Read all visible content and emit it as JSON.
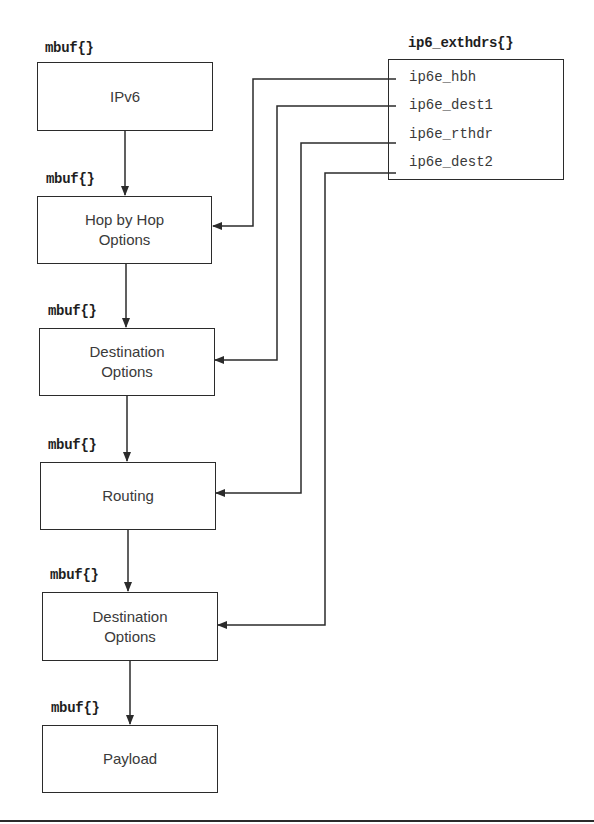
{
  "diagram": {
    "type": "mbuf chain with extension header pointers",
    "chain_label": "mbuf{}",
    "chain": [
      {
        "id": "ipv6",
        "label": "IPv6",
        "mbuf_label": "mbuf{}"
      },
      {
        "id": "hbh",
        "label": "Hop by Hop\nOptions",
        "mbuf_label": "mbuf{}"
      },
      {
        "id": "dest1",
        "label": "Destination\nOptions",
        "mbuf_label": "mbuf{}"
      },
      {
        "id": "routing",
        "label": "Routing",
        "mbuf_label": "mbuf{}"
      },
      {
        "id": "dest2",
        "label": "Destination\nOptions",
        "mbuf_label": "mbuf{}"
      },
      {
        "id": "payload",
        "label": "Payload",
        "mbuf_label": "mbuf{}"
      }
    ],
    "struct": {
      "title": "ip6_exthdrs{}",
      "fields": [
        {
          "name": "ip6e_hbh",
          "points_to": "hbh"
        },
        {
          "name": "ip6e_dest1",
          "points_to": "dest1"
        },
        {
          "name": "ip6e_rthdr",
          "points_to": "routing"
        },
        {
          "name": "ip6e_dest2",
          "points_to": "dest2"
        }
      ]
    },
    "edges": [
      {
        "from": "ipv6",
        "to": "hbh"
      },
      {
        "from": "hbh",
        "to": "dest1"
      },
      {
        "from": "dest1",
        "to": "routing"
      },
      {
        "from": "routing",
        "to": "dest2"
      },
      {
        "from": "dest2",
        "to": "payload"
      },
      {
        "from": "ip6e_hbh",
        "to": "hbh"
      },
      {
        "from": "ip6e_dest1",
        "to": "dest1"
      },
      {
        "from": "ip6e_rthdr",
        "to": "routing"
      },
      {
        "from": "ip6e_dest2",
        "to": "dest2"
      }
    ],
    "colors": {
      "line": "#2b2b2b",
      "text": "#3a3a3a",
      "background": "#ffffff"
    }
  }
}
